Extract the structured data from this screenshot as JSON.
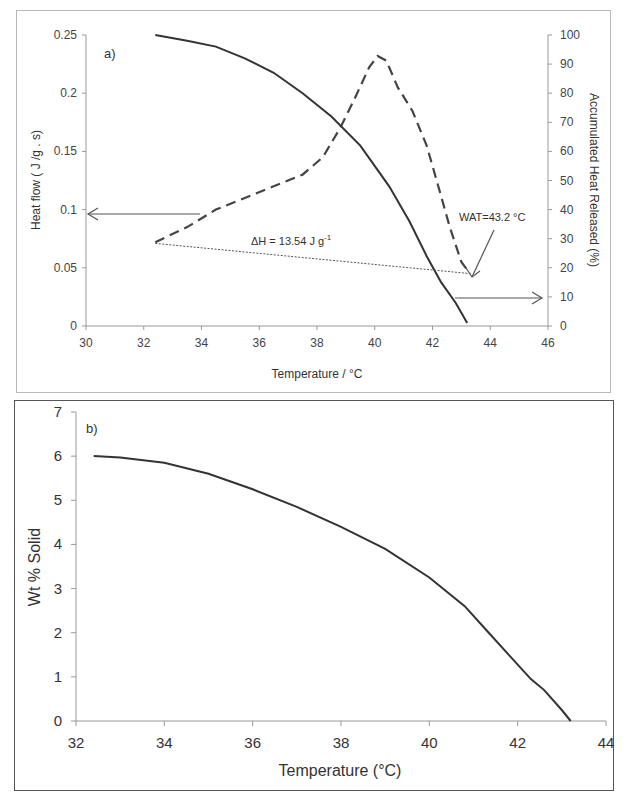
{
  "chart_data": [
    {
      "panel_label": "a)",
      "type": "line",
      "xlabel": "Temperature / °C",
      "ylabel": "Heat flow  ( J /g . s)",
      "y2label": "Accumulated  Heat  Released  (%)",
      "xlim": [
        30,
        46
      ],
      "ylim": [
        0,
        0.25
      ],
      "y2lim": [
        0,
        100
      ],
      "x_ticks": [
        "30",
        "32",
        "34",
        "36",
        "38",
        "40",
        "42",
        "44",
        "46"
      ],
      "y_ticks": [
        "0",
        "0.05",
        "0.1",
        "0.15",
        "0.2",
        "0.25"
      ],
      "y2_ticks": [
        "0",
        "10",
        "20",
        "30",
        "40",
        "50",
        "60",
        "70",
        "80",
        "90",
        "100"
      ],
      "grid": false,
      "series": [
        {
          "name": "Heat flow",
          "axis": "left",
          "style": "dashed",
          "x": [
            32.4,
            33.5,
            34.5,
            35.5,
            36.5,
            37.5,
            38.2,
            38.8,
            39.3,
            39.8,
            40.1,
            40.4,
            40.8,
            41.3,
            41.8,
            42.2,
            42.6,
            43.0,
            43.3
          ],
          "y": [
            0.072,
            0.085,
            0.1,
            0.11,
            0.12,
            0.13,
            0.145,
            0.17,
            0.195,
            0.222,
            0.232,
            0.228,
            0.205,
            0.185,
            0.155,
            0.12,
            0.085,
            0.055,
            0.045
          ]
        },
        {
          "name": "Accumulated Heat Released",
          "axis": "right",
          "style": "solid",
          "x": [
            32.4,
            33.5,
            34.5,
            35.5,
            36.5,
            37.5,
            38.5,
            39.5,
            40.5,
            41.2,
            41.8,
            42.3,
            42.8,
            43.2
          ],
          "y": [
            100,
            98,
            96,
            92,
            87,
            80,
            72,
            62,
            48,
            36,
            24,
            15,
            8,
            1
          ]
        },
        {
          "name": "Baseline",
          "axis": "left",
          "style": "dotted",
          "x": [
            32.4,
            43.3
          ],
          "y": [
            0.071,
            0.045
          ]
        }
      ],
      "annotations": [
        {
          "text": "ΔH = 13.54 J g",
          "superscript": "-1",
          "x": 37.8,
          "y": 0.078
        },
        {
          "text": "WAT=43.2 °C",
          "x": 43.9,
          "y": 0.093
        }
      ],
      "arrows": [
        {
          "from": [
            34,
            0.095
          ],
          "to": [
            30,
            0.095
          ],
          "meaning": "dashed curve reads left axis"
        },
        {
          "from": [
            42.8,
            0.025
          ],
          "to": [
            46,
            0.025
          ],
          "meaning": "solid curve reads right axis"
        },
        {
          "from": [
            44,
            0.08
          ],
          "to": [
            43.3,
            0.048
          ],
          "meaning": "points to WAT"
        }
      ]
    },
    {
      "panel_label": "b)",
      "type": "line",
      "xlabel": "Temperature  (°C)",
      "ylabel": "Wt %  Solid",
      "xlim": [
        32,
        44
      ],
      "ylim": [
        0,
        7
      ],
      "x_ticks": [
        "32",
        "34",
        "36",
        "38",
        "40",
        "42",
        "44"
      ],
      "y_ticks": [
        "0",
        "1",
        "2",
        "3",
        "4",
        "5",
        "6",
        "7"
      ],
      "grid": false,
      "series": [
        {
          "name": "Wt % Solid",
          "style": "solid",
          "x": [
            32.4,
            33.0,
            34.0,
            35.0,
            36.0,
            37.0,
            38.0,
            39.0,
            40.0,
            40.8,
            41.3,
            41.8,
            42.3,
            42.6,
            43.0,
            43.2
          ],
          "y": [
            6.0,
            5.97,
            5.85,
            5.6,
            5.25,
            4.85,
            4.4,
            3.9,
            3.25,
            2.6,
            2.05,
            1.5,
            0.95,
            0.7,
            0.25,
            0.0
          ]
        }
      ]
    }
  ],
  "panels": {
    "a": {
      "label": "a)",
      "xlabel": "Temperature / °C",
      "ylabel": "Heat flow  ( J /g . s)",
      "y2label": "Accumulated  Heat  Released  (%)",
      "dh_label": "ΔH = 13.54 J g",
      "dh_sup": "-1",
      "wat_label": "WAT=43.2 °C",
      "x_ticks": [
        "30",
        "32",
        "34",
        "36",
        "38",
        "40",
        "42",
        "44",
        "46"
      ],
      "y_ticks": [
        "0",
        "0.05",
        "0.1",
        "0.15",
        "0.2",
        "0.25"
      ],
      "y2_ticks": [
        "0",
        "10",
        "20",
        "30",
        "40",
        "50",
        "60",
        "70",
        "80",
        "90",
        "100"
      ]
    },
    "b": {
      "label": "b)",
      "xlabel": "Temperature  (°C)",
      "ylabel": "Wt %  Solid",
      "x_ticks": [
        "32",
        "34",
        "36",
        "38",
        "40",
        "42",
        "44"
      ],
      "y_ticks": [
        "0",
        "1",
        "2",
        "3",
        "4",
        "5",
        "6",
        "7"
      ]
    }
  },
  "colors": {
    "line": "#333333",
    "axis": "#999999",
    "frame_a": "#b8b8b8",
    "frame_b": "#555555"
  }
}
